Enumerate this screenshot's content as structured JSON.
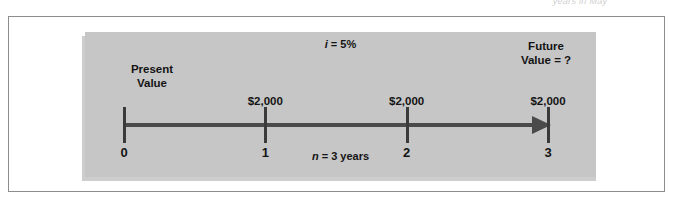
{
  "figure": {
    "page_bleed_text": "years in May",
    "panel_background": "#c6c6c6",
    "frame_border_color": "#8d8d8d",
    "line_color": "#4a4a4a"
  },
  "labels": {
    "interest_rate_symbol": "i",
    "interest_rate_rest": " = 5%",
    "present_value": "Present\nValue",
    "present_value_line1": "Present",
    "present_value_line2": "Value",
    "future_value_line1": "Future",
    "future_value_line2": "Value = ?",
    "periods_symbol": "n",
    "periods_rest": " = 3 years"
  },
  "timeline": {
    "ticks": [
      {
        "label": "0",
        "x_pct": 0,
        "cashflow": ""
      },
      {
        "label": "1",
        "x_pct": 33.33,
        "cashflow": "$2,000"
      },
      {
        "label": "2",
        "x_pct": 66.67,
        "cashflow": "$2,000"
      },
      {
        "label": "3",
        "x_pct": 100,
        "cashflow": "$2,000"
      }
    ],
    "direction": "right",
    "arrow_head": "right-triangle"
  },
  "chart_data": {
    "type": "timeline",
    "interest_rate": 0.05,
    "interest_rate_display": "i = 5%",
    "periods": 3,
    "periods_display": "n = 3 years",
    "x": [
      0,
      1,
      2,
      3
    ],
    "xlabel": "Year",
    "cash_flows": [
      0,
      2000,
      2000,
      2000
    ],
    "cash_flow_labels": [
      "",
      "$2,000",
      "$2,000",
      "$2,000"
    ],
    "present_value": "Present Value",
    "future_value": "Future Value = ?",
    "annotations": [
      "i = 5%",
      "Present Value",
      "Future Value = ?",
      "n = 3 years"
    ]
  }
}
